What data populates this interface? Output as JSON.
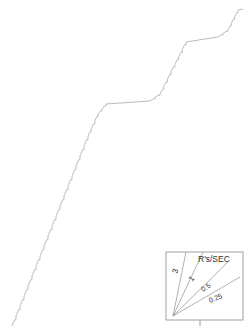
{
  "figure": {
    "name": "cumulative-response-record",
    "background": "#ffffff",
    "width": 248,
    "height": 330,
    "curve_color": "#a9a9a9",
    "inset_color": "#8a8a8a"
  },
  "chart_data": {
    "type": "line",
    "title": "",
    "subtitle": "",
    "xlabel": "",
    "ylabel": "",
    "grid": false,
    "legend_position": "inset-bottom-right",
    "axis_ranges": {
      "xlim": [
        0,
        248
      ],
      "ylim": [
        0,
        330
      ]
    },
    "series": [
      {
        "name": "cumulative record",
        "style": "staircase",
        "points": [
          [
            12,
            326
          ],
          [
            14,
            318
          ],
          [
            16,
            316
          ],
          [
            18,
            308
          ],
          [
            20,
            306
          ],
          [
            22,
            298
          ],
          [
            24,
            296
          ],
          [
            26,
            288
          ],
          [
            28,
            286
          ],
          [
            30,
            278
          ],
          [
            32,
            276
          ],
          [
            34,
            268
          ],
          [
            36,
            266
          ],
          [
            38,
            258
          ],
          [
            40,
            256
          ],
          [
            42,
            248
          ],
          [
            44,
            246
          ],
          [
            46,
            238
          ],
          [
            48,
            236
          ],
          [
            50,
            228
          ],
          [
            52,
            226
          ],
          [
            54,
            218
          ],
          [
            56,
            216
          ],
          [
            58,
            208
          ],
          [
            60,
            206
          ],
          [
            62,
            198
          ],
          [
            64,
            196
          ],
          [
            66,
            188
          ],
          [
            68,
            186
          ],
          [
            70,
            178
          ],
          [
            72,
            176
          ],
          [
            74,
            168
          ],
          [
            76,
            166
          ],
          [
            78,
            158
          ],
          [
            80,
            156
          ],
          [
            34,
            268
          ],
          [
            36,
            266
          ],
          [
            40,
            150
          ],
          [
            44,
            148
          ],
          [
            48,
            146
          ],
          [
            52,
            145
          ],
          [
            56,
            144
          ],
          [
            60,
            143
          ],
          [
            64,
            142
          ],
          [
            68,
            141
          ],
          [
            72,
            140
          ],
          [
            76,
            139
          ],
          [
            80,
            138
          ],
          [
            84,
            137
          ],
          [
            88,
            136
          ],
          [
            90,
            130
          ],
          [
            92,
            128
          ],
          [
            94,
            122
          ],
          [
            96,
            120
          ],
          [
            98,
            114
          ],
          [
            100,
            112
          ],
          [
            102,
            108
          ],
          [
            104,
            106
          ],
          [
            106,
            104
          ],
          [
            110,
            103
          ],
          [
            118,
            103
          ],
          [
            126,
            102
          ],
          [
            134,
            102
          ],
          [
            142,
            101
          ],
          [
            150,
            101
          ],
          [
            152,
            96
          ],
          [
            156,
            95
          ],
          [
            160,
            94
          ],
          [
            162,
            88
          ],
          [
            164,
            86
          ],
          [
            166,
            80
          ],
          [
            168,
            78
          ],
          [
            170,
            72
          ],
          [
            172,
            70
          ],
          [
            174,
            64
          ],
          [
            176,
            62
          ],
          [
            178,
            56
          ],
          [
            180,
            54
          ],
          [
            182,
            48
          ],
          [
            184,
            46
          ],
          [
            186,
            42
          ],
          [
            190,
            41
          ],
          [
            198,
            40
          ],
          [
            206,
            39
          ],
          [
            212,
            38
          ],
          [
            218,
            37
          ],
          [
            220,
            32
          ],
          [
            224,
            31
          ],
          [
            228,
            30
          ],
          [
            230,
            24
          ],
          [
            232,
            22
          ],
          [
            234,
            16
          ],
          [
            236,
            14
          ],
          [
            238,
            10
          ],
          [
            242,
            9
          ]
        ]
      }
    ],
    "inset": {
      "name": "rate-reference-fan",
      "box": {
        "x": 166,
        "y": 252,
        "w": 77,
        "h": 68
      },
      "header_label": "R's/SEC",
      "origin": [
        173,
        316
      ],
      "rays": [
        {
          "label": "3",
          "value": 3,
          "end": [
            186,
            252
          ],
          "label_pos": [
            177,
            274
          ],
          "label_rotate": -71
        },
        {
          "label": "1",
          "value": 1,
          "end": [
            203,
            252
          ],
          "label_pos": [
            192,
            282
          ],
          "label_rotate": -50
        },
        {
          "label": "0.5",
          "value": 0.5,
          "end": [
            228,
            262
          ],
          "label_pos": [
            203,
            292
          ],
          "label_rotate": -33
        },
        {
          "label": "0.25",
          "value": 0.25,
          "end": [
            240,
            277
          ],
          "label_pos": [
            210,
            303
          ],
          "label_rotate": -22
        }
      ],
      "axis_tick": {
        "x": 200,
        "y_from": 320,
        "y_to": 326
      }
    }
  }
}
